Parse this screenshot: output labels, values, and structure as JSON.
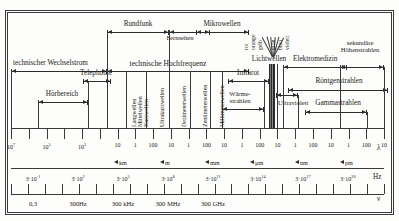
{
  "figure": {
    "type": "spectrum-diagram",
    "language": "de",
    "axis_symbols": {
      "wavelength": "λ",
      "frequency": "ν",
      "freq_unit": "Hz"
    }
  },
  "top_bands": [
    {
      "name": "rundfunk",
      "label": "Rundfunk"
    },
    {
      "name": "fernsehen",
      "label": "Fernsehen"
    },
    {
      "name": "mikrowellen",
      "label": "Mikrowellen"
    },
    {
      "name": "lichtwellen",
      "label": "Lichtwellen"
    },
    {
      "name": "elektromedizin",
      "label": "Elektromedizin"
    },
    {
      "name": "sekundaere-hoehenstrahlen",
      "label_line1": "sekundäre",
      "label_line2": "Höhenstrahlen"
    }
  ],
  "mid_bands": [
    {
      "name": "technischer-wechselstrom",
      "label": "technischer Wechselstrom"
    },
    {
      "name": "technische-hochfrequenz",
      "label": "technische Hochfrequenz"
    },
    {
      "name": "telephonie",
      "label": "Telephonie"
    },
    {
      "name": "infrarot",
      "label": "Infrarot"
    },
    {
      "name": "hoerbereich",
      "label": "Hörbereich"
    },
    {
      "name": "waermestrahlen",
      "label_line1": "Wärme-",
      "label_line2": "strahlen"
    },
    {
      "name": "ultraviolett",
      "label": "Ultraviolett"
    },
    {
      "name": "roentgenstrahlen",
      "label": "Röntgenstrahlen"
    },
    {
      "name": "gammastrahlen",
      "label": "Gammastrahlen"
    }
  ],
  "vertical_bands": [
    {
      "name": "langwellen",
      "label": "Langwellen"
    },
    {
      "name": "mittelwellen",
      "label": "Mittelwellen"
    },
    {
      "name": "kurzwellen",
      "label": "Kurzwellen"
    },
    {
      "name": "ultrakurzwellen",
      "label": "Ultrakurzwellen"
    },
    {
      "name": "dezimeterwellen",
      "label": "Dezimeterwellen"
    },
    {
      "name": "zentimeterwellen",
      "label": "Zentimeterwellen"
    },
    {
      "name": "millimeterwellen",
      "label": "Millimeterwellen"
    }
  ],
  "light_colors": [
    {
      "name": "rot",
      "label": "rot"
    },
    {
      "name": "orange",
      "label": "orange"
    },
    {
      "name": "gelb",
      "label": "gelb"
    },
    {
      "name": "gruen",
      "label": "grün"
    },
    {
      "name": "blau",
      "label": "blau"
    },
    {
      "name": "violett",
      "label": "violett"
    }
  ],
  "chart_data": {
    "type": "heatmap",
    "title": "",
    "xlabel": "",
    "ylabel": "",
    "grid": false,
    "legend": "none",
    "wavelength_axis": {
      "symbol": "λ",
      "tick_labels": [
        "10⁷",
        "",
        "10⁵",
        "",
        "10³",
        "",
        "10",
        "1",
        "100",
        "10",
        "1",
        "100",
        "10",
        "1",
        "100",
        "10",
        "1",
        "100",
        "10",
        "1",
        "100",
        "10"
      ],
      "unit_markers": [
        "km",
        "m",
        "mm",
        "µm",
        "nm",
        "pm"
      ]
    },
    "frequency_axis": {
      "symbol": "ν",
      "unit": "Hz",
      "tick_labels": [
        "3·10⁻¹",
        "3·10²",
        "3·10⁵",
        "3·10⁸",
        "3·10¹¹",
        "3·10¹⁴",
        "3·10¹⁷",
        "3·10²⁰"
      ],
      "named_labels": [
        "0,3",
        "300Hz",
        "300 kHz",
        "300 MHz",
        "300 GHz"
      ]
    }
  }
}
